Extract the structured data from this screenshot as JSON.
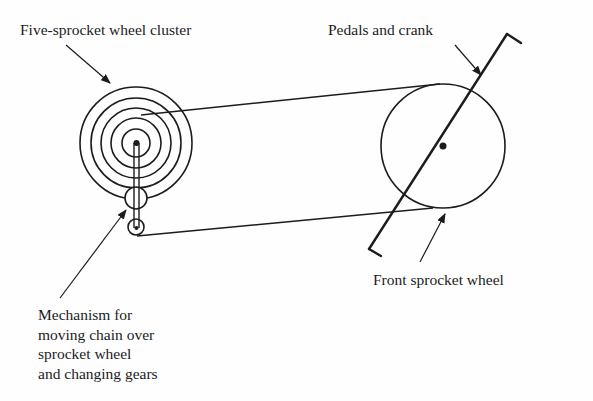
{
  "diagram": {
    "type": "bicycle-gear-mechanism",
    "labels": {
      "cluster": "Five-sprocket wheel cluster",
      "pedals": "Pedals and crank",
      "front_wheel": "Front sprocket wheel",
      "mechanism": [
        "Mechanism for",
        "moving chain over",
        "sprocket wheel",
        "and changing gears"
      ]
    },
    "components": {
      "sprocket_cluster": {
        "center": [
          136,
          143
        ],
        "ring_radii": [
          56,
          45,
          35,
          25,
          14
        ]
      },
      "derailleur": {
        "upper_pulley": {
          "center": [
            136,
            198
          ],
          "r": 11
        },
        "lower_pulley": {
          "center": [
            136,
            227
          ],
          "r": 8
        }
      },
      "front_sprocket": {
        "center": [
          443,
          146
        ],
        "r": 62
      },
      "crank": {
        "from": [
          369,
          249
        ],
        "to": [
          507,
          34
        ]
      }
    },
    "colors": {
      "ink": "#1c1c1c",
      "background": "#fefefe"
    }
  }
}
